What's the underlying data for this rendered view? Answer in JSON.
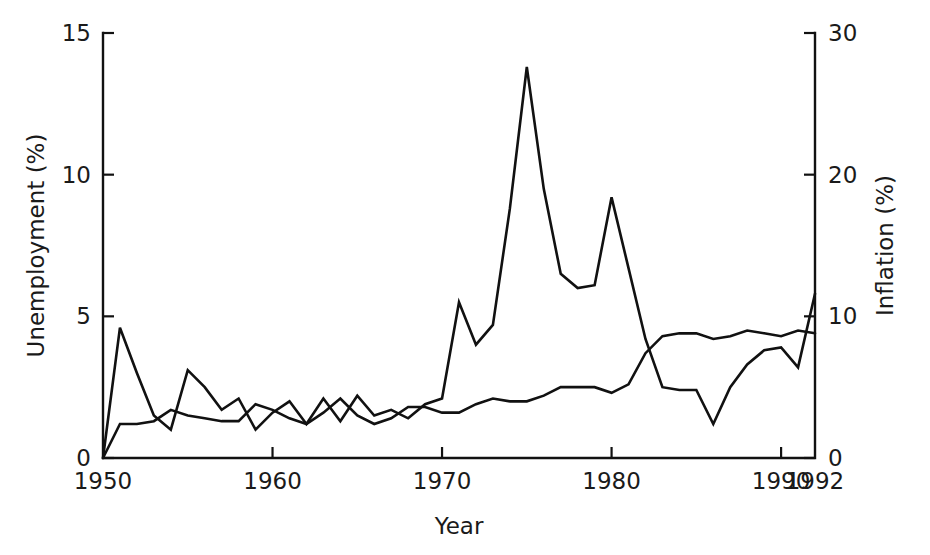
{
  "chart_data": {
    "type": "line",
    "title": "",
    "subtitle": "",
    "xlabel": "Year",
    "ylabel": "Unemployment (%)",
    "y2label": "Inflation (%)",
    "xlim": [
      1950,
      1992
    ],
    "ylim": [
      0,
      15
    ],
    "y2lim": [
      0,
      30
    ],
    "grid": false,
    "legend": "none",
    "x_ticks": [
      1950,
      1960,
      1970,
      1980,
      1990,
      1992
    ],
    "x_tick_labels": [
      "1950",
      "1960",
      "1970",
      "1980",
      "1990",
      "1992"
    ],
    "x_major_ticks": [
      1960,
      1970,
      1980,
      1990
    ],
    "y_ticks": [
      0,
      5,
      10,
      15
    ],
    "y_tick_labels": [
      "0",
      "5",
      "10",
      "15"
    ],
    "y2_ticks": [
      0,
      10,
      20,
      30
    ],
    "y2_tick_labels": [
      "0",
      "10",
      "20",
      "30"
    ],
    "x": [
      1950,
      1951,
      1952,
      1953,
      1954,
      1955,
      1956,
      1957,
      1958,
      1959,
      1960,
      1961,
      1962,
      1963,
      1964,
      1965,
      1966,
      1967,
      1968,
      1969,
      1970,
      1971,
      1972,
      1973,
      1974,
      1975,
      1976,
      1977,
      1978,
      1979,
      1980,
      1981,
      1982,
      1983,
      1984,
      1985,
      1986,
      1987,
      1988,
      1989,
      1990,
      1991,
      1992
    ],
    "series": [
      {
        "name": "Unemployment (%)",
        "axis": "left",
        "units": "%",
        "values": [
          0.0,
          1.2,
          1.2,
          1.3,
          1.7,
          1.5,
          1.4,
          1.3,
          1.3,
          1.9,
          1.7,
          1.4,
          1.2,
          1.6,
          2.1,
          1.5,
          1.2,
          1.4,
          1.8,
          1.8,
          1.6,
          1.6,
          1.9,
          2.1,
          2.0,
          2.0,
          2.2,
          2.5,
          2.5,
          2.5,
          2.3,
          2.6,
          3.7,
          4.3,
          4.4,
          4.4,
          4.2,
          4.3,
          4.5,
          4.4,
          4.3,
          4.5,
          4.4
        ],
        "display_values": [
          0.0,
          1.2,
          1.2,
          1.3,
          1.7,
          1.5,
          1.4,
          1.3,
          1.3,
          1.9,
          1.7,
          1.4,
          1.2,
          1.6,
          2.1,
          1.5,
          1.2,
          1.4,
          1.8,
          1.8,
          1.6,
          1.6,
          1.9,
          2.1,
          2.0,
          2.0,
          2.2,
          2.5,
          2.5,
          2.5,
          2.3,
          2.6,
          3.7,
          4.3,
          4.4,
          4.4,
          4.2,
          4.3,
          4.5,
          4.4,
          4.3,
          4.5,
          4.4
        ]
      },
      {
        "name": "Inflation (%)",
        "axis": "right",
        "units": "%",
        "values": [
          0.0,
          9.2,
          6.0,
          3.0,
          2.0,
          6.2,
          5.0,
          3.4,
          4.2,
          2.0,
          3.2,
          4.0,
          2.4,
          4.2,
          2.6,
          4.4,
          3.0,
          3.4,
          2.8,
          3.8,
          4.2,
          11.0,
          8.0,
          9.4,
          17.6,
          27.6,
          19.0,
          13.0,
          12.0,
          12.2,
          18.4,
          13.4,
          8.4,
          5.0,
          4.8,
          4.8,
          2.4,
          5.0,
          6.6,
          7.6,
          7.8,
          6.4,
          11.6
        ],
        "display_values": [
          0.0,
          9.2,
          6.0,
          3.0,
          2.0,
          6.2,
          5.0,
          3.4,
          4.2,
          2.0,
          3.2,
          4.0,
          2.4,
          4.2,
          2.6,
          4.4,
          3.0,
          3.4,
          2.8,
          3.8,
          4.2,
          11.0,
          8.0,
          9.4,
          17.6,
          27.6,
          19.0,
          13.0,
          12.0,
          12.2,
          18.4,
          13.4,
          8.4,
          5.0,
          4.8,
          4.8,
          2.4,
          5.0,
          6.6,
          7.6,
          7.8,
          6.4,
          11.6
        ]
      }
    ],
    "colors": {
      "line": "#111111",
      "axis": "#111111",
      "text": "#1a1a1a",
      "background": "#ffffff"
    }
  }
}
